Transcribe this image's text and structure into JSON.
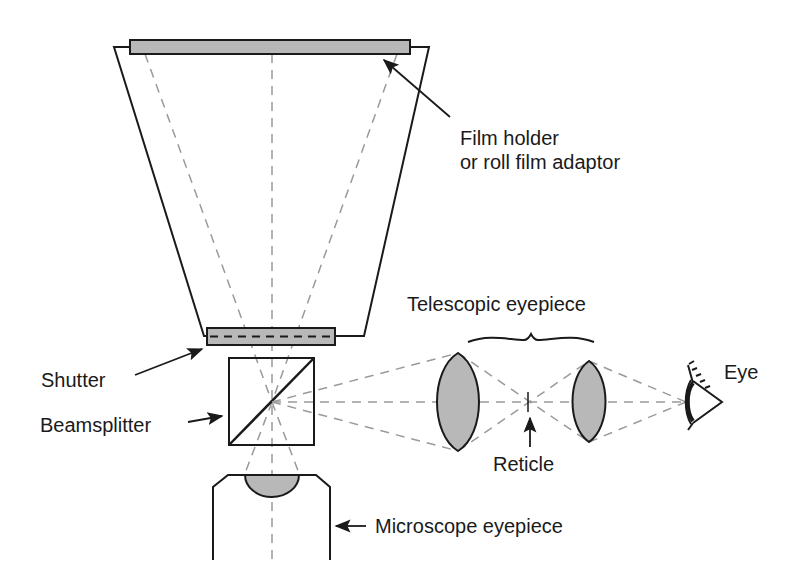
{
  "diagram": {
    "type": "optical-schematic",
    "colors": {
      "line": "#1a1a1a",
      "ray": "#9a9a9a",
      "fill": "#b8b8b8",
      "background": "#ffffff"
    },
    "labels": {
      "film_holder_line1": "Film holder",
      "film_holder_line2": "or roll film adaptor",
      "telescopic_eyepiece": "Telescopic eyepiece",
      "eye": "Eye",
      "shutter": "Shutter",
      "beamsplitter": "Beamsplitter",
      "reticle": "Reticle",
      "microscope_eyepiece": "Microscope eyepiece"
    },
    "components": [
      {
        "id": "film-holder",
        "label": "Film holder or roll film adaptor"
      },
      {
        "id": "camera-body",
        "label": ""
      },
      {
        "id": "shutter",
        "label": "Shutter"
      },
      {
        "id": "beamsplitter",
        "label": "Beamsplitter"
      },
      {
        "id": "microscope-eyepiece",
        "label": "Microscope eyepiece"
      },
      {
        "id": "objective-lens",
        "label": ""
      },
      {
        "id": "field-lens",
        "label": ""
      },
      {
        "id": "reticle",
        "label": "Reticle"
      },
      {
        "id": "eye-lens",
        "label": ""
      },
      {
        "id": "eye",
        "label": "Eye"
      }
    ]
  }
}
